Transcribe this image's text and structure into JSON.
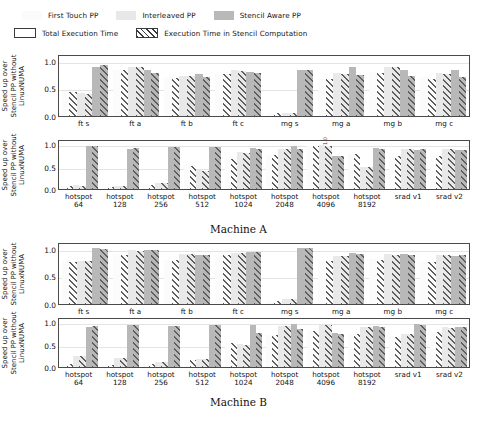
{
  "legend": {
    "row1": [
      {
        "key": "first",
        "label": "First Touch PP",
        "color": "#fbfbfb"
      },
      {
        "key": "inter",
        "label": "Interleaved PP",
        "color": "#e8e8e8"
      },
      {
        "key": "sten",
        "label": "Stencil Aware PP",
        "color": "#b9b9b9"
      }
    ],
    "row2": [
      {
        "key": "total",
        "label": "Total Execution Time",
        "icon": "open-rect-swatch"
      },
      {
        "key": "hatch",
        "label": "Execution Time in Stencil Computation",
        "icon": "hatched-rect-swatch"
      }
    ]
  },
  "captions": {
    "machine_a": "Machine A",
    "machine_b": "Machine B"
  },
  "axis": {
    "ylabel": "Speed up over\nStencil PP without\nLinuxNUMA",
    "ylabel_line1": "Speed up over",
    "ylabel_line2": "Stencil PP without",
    "ylabel_line3": "LinuxNUMA",
    "yticks": [
      "0.0",
      "0.5",
      "1.0"
    ],
    "ylim": [
      0.0,
      1.12
    ],
    "ytick_values": [
      0.0,
      0.5,
      1.0
    ]
  },
  "annotations": {
    "a2_hotspot4096": "1.0"
  },
  "chart_data": [
    {
      "id": "machine-a-nas",
      "type": "bar",
      "title": "Machine A — NAS kernels",
      "xlabel": "",
      "ylabel": "Speed up over Stencil PP without LinuxNUMA",
      "ylim": [
        0.0,
        1.12
      ],
      "yticks": [
        0.0,
        0.5,
        1.0
      ],
      "grid": true,
      "categories": [
        "ft s",
        "ft a",
        "ft b",
        "ft c",
        "mg s",
        "mg a",
        "mg b",
        "mg c"
      ],
      "series": [
        {
          "name": "First Touch PP - Total Execution Time",
          "key": "first_total",
          "values": [
            0.47,
            0.86,
            0.72,
            0.79,
            0.05,
            0.7,
            0.82,
            0.72
          ]
        },
        {
          "name": "First Touch PP - Execution Time in Stencil Computation",
          "key": "first_stencil",
          "values": [
            0.45,
            0.85,
            0.71,
            0.78,
            0.05,
            0.69,
            0.8,
            0.7
          ]
        },
        {
          "name": "Interleaved PP - Total Execution Time",
          "key": "inter_total",
          "values": [
            0.43,
            0.92,
            0.74,
            0.85,
            0.06,
            0.8,
            0.92,
            0.8
          ]
        },
        {
          "name": "Interleaved PP - Execution Time in Stencil Computation",
          "key": "inter_stencil",
          "values": [
            0.42,
            0.91,
            0.74,
            0.84,
            0.06,
            0.79,
            0.91,
            0.79
          ]
        },
        {
          "name": "Stencil Aware PP - Total Execution Time",
          "key": "sten_total",
          "values": [
            0.92,
            0.86,
            0.78,
            0.83,
            0.86,
            0.91,
            0.85,
            0.86
          ]
        },
        {
          "name": "Stencil Aware PP - Execution Time in Stencil Computation",
          "key": "sten_stencil",
          "values": [
            0.95,
            0.81,
            0.72,
            0.81,
            0.86,
            0.77,
            0.74,
            0.73
          ]
        }
      ]
    },
    {
      "id": "machine-a-rodinia",
      "type": "bar",
      "title": "Machine A — Rodinia kernels",
      "xlabel": "",
      "ylabel": "Speed up over Stencil PP without LinuxNUMA",
      "ylim": [
        0.0,
        1.12
      ],
      "yticks": [
        0.0,
        0.5,
        1.0
      ],
      "grid": true,
      "categories": [
        "hotspot\n64",
        "hotspot\n128",
        "hotspot\n256",
        "hotspot\n512",
        "hotspot\n1024",
        "hotspot\n2048",
        "hotspot\n4096",
        "hotspot\n8192",
        "srad v1",
        "srad v2"
      ],
      "series": [
        {
          "name": "First Touch PP - Total Execution Time",
          "key": "first_total",
          "values": [
            0.08,
            0.05,
            0.11,
            0.55,
            0.7,
            0.8,
            1.0,
            0.82,
            0.78,
            0.78
          ]
        },
        {
          "name": "First Touch PP - Execution Time in Stencil Computation",
          "key": "first_stencil",
          "values": [
            0.07,
            0.04,
            0.1,
            0.54,
            0.69,
            0.79,
            1.0,
            0.81,
            0.77,
            0.77
          ]
        },
        {
          "name": "Interleaved PP - Total Execution Time",
          "key": "inter_total",
          "values": [
            0.09,
            0.08,
            0.14,
            0.44,
            0.86,
            0.94,
            1.02,
            0.52,
            0.94,
            0.94
          ]
        },
        {
          "name": "Interleaved PP - Execution Time in Stencil Computation",
          "key": "inter_stencil",
          "values": [
            0.08,
            0.07,
            0.13,
            0.43,
            0.85,
            0.93,
            1.01,
            0.51,
            0.93,
            0.93
          ]
        },
        {
          "name": "Stencil Aware PP - Total Execution Time",
          "key": "sten_total",
          "values": [
            1.0,
            0.94,
            0.98,
            0.97,
            0.95,
            1.0,
            0.78,
            0.95,
            0.92,
            0.92
          ]
        },
        {
          "name": "Stencil Aware PP - Execution Time in Stencil Computation",
          "key": "sten_stencil",
          "values": [
            1.0,
            0.96,
            0.99,
            0.98,
            0.93,
            0.94,
            0.77,
            0.93,
            0.94,
            0.9
          ]
        }
      ]
    },
    {
      "id": "machine-b-nas",
      "type": "bar",
      "title": "Machine B — NAS kernels",
      "xlabel": "",
      "ylabel": "Speed up over Stencil PP without LinuxNUMA",
      "ylim": [
        0.0,
        1.12
      ],
      "yticks": [
        0.0,
        0.5,
        1.0
      ],
      "grid": true,
      "categories": [
        "ft s",
        "ft a",
        "ft b",
        "ft c",
        "mg s",
        "mg a",
        "mg b",
        "mg c"
      ],
      "series": [
        {
          "name": "First Touch PP - Total Execution Time",
          "key": "first_total",
          "values": [
            0.8,
            0.93,
            0.83,
            0.92,
            0.06,
            0.82,
            0.84,
            0.8
          ]
        },
        {
          "name": "First Touch PP - Execution Time in Stencil Computation",
          "key": "first_stencil",
          "values": [
            0.79,
            0.92,
            0.82,
            0.91,
            0.05,
            0.81,
            0.83,
            0.79
          ]
        },
        {
          "name": "Interleaved PP - Total Execution Time",
          "key": "inter_total",
          "values": [
            0.81,
            1.0,
            0.94,
            0.96,
            0.1,
            0.9,
            0.93,
            0.92
          ]
        },
        {
          "name": "Interleaved PP - Execution Time in Stencil Computation",
          "key": "inter_stencil",
          "values": [
            0.8,
            0.99,
            0.93,
            0.95,
            0.09,
            0.89,
            0.92,
            0.91
          ]
        },
        {
          "name": "Stencil Aware PP - Total Execution Time",
          "key": "sten_total",
          "values": [
            1.04,
            1.0,
            0.92,
            0.97,
            1.04,
            0.95,
            0.94,
            0.89
          ]
        },
        {
          "name": "Stencil Aware PP - Execution Time in Stencil Computation",
          "key": "sten_stencil",
          "values": [
            1.03,
            1.0,
            0.92,
            0.97,
            1.04,
            0.94,
            0.92,
            0.91
          ]
        }
      ]
    },
    {
      "id": "machine-b-rodinia",
      "type": "bar",
      "title": "Machine B — Rodinia kernels",
      "xlabel": "",
      "ylabel": "Speed up over Stencil PP without LinuxNUMA",
      "ylim": [
        0.0,
        1.12
      ],
      "yticks": [
        0.0,
        0.5,
        1.0
      ],
      "grid": true,
      "categories": [
        "hotspot\n64",
        "hotspot\n128",
        "hotspot\n256",
        "hotspot\n512",
        "hotspot\n1024",
        "hotspot\n2048",
        "hotspot\n4096",
        "hotspot\n8192",
        "srad v1",
        "srad v2"
      ],
      "series": [
        {
          "name": "First Touch PP - Total Execution Time",
          "key": "first_total",
          "values": [
            0.07,
            0.05,
            0.09,
            0.17,
            0.56,
            0.75,
            0.86,
            0.78,
            0.72,
            0.82
          ]
        },
        {
          "name": "First Touch PP - Execution Time in Stencil Computation",
          "key": "first_stencil",
          "values": [
            0.06,
            0.04,
            0.08,
            0.16,
            0.55,
            0.74,
            0.85,
            0.77,
            0.71,
            0.81
          ]
        },
        {
          "name": "Interleaved PP - Total Execution Time",
          "key": "inter_total",
          "values": [
            0.26,
            0.21,
            0.12,
            0.19,
            0.53,
            0.96,
            0.98,
            0.94,
            0.77,
            0.93
          ]
        },
        {
          "name": "Interleaved PP - Execution Time in Stencil Computation",
          "key": "inter_stencil",
          "values": [
            0.25,
            0.2,
            0.11,
            0.18,
            0.52,
            0.95,
            0.97,
            0.93,
            0.76,
            0.92
          ]
        },
        {
          "name": "Stencil Aware PP - Total Execution Time",
          "key": "sten_total",
          "values": [
            0.94,
            0.98,
            0.96,
            0.98,
            0.97,
            1.0,
            0.8,
            0.95,
            1.01,
            0.94
          ]
        },
        {
          "name": "Stencil Aware PP - Execution Time in Stencil Computation",
          "key": "sten_stencil",
          "values": [
            0.95,
            0.97,
            0.96,
            0.98,
            0.79,
            0.88,
            0.77,
            0.93,
            0.99,
            0.93
          ]
        }
      ]
    }
  ]
}
